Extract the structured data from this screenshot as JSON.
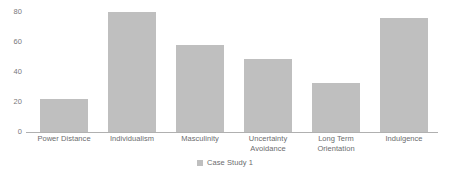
{
  "chart_data": {
    "type": "bar",
    "title": "",
    "subtitle": "",
    "xlabel": "",
    "ylabel": "",
    "categories": [
      "Power Distance",
      "Individualism",
      "Masculinity",
      "Uncertainty Avoidance",
      "Long Term Orientation",
      "Indulgence"
    ],
    "category_lines": [
      [
        "Power Distance"
      ],
      [
        "Individualism"
      ],
      [
        "Masculinity"
      ],
      [
        "Uncertainty",
        "Avoidance"
      ],
      [
        "Long Term",
        "Orientation"
      ],
      [
        "Indulgence"
      ]
    ],
    "series": [
      {
        "name": "Case Study 1",
        "color": "#bfbfbf",
        "values": [
          22,
          80,
          58,
          49,
          33,
          76
        ]
      }
    ],
    "ylim": [
      0,
      80
    ],
    "yticks": [
      0,
      20,
      40,
      60,
      80
    ],
    "ytick_labels": [
      "0",
      "20",
      "40",
      "60",
      "80"
    ],
    "grid": false,
    "legend_position": "bottom-center",
    "axis_color": "#b0b0b0",
    "tick_label_color": "#77787b"
  },
  "legend": {
    "entries": [
      {
        "label": "Case Study 1",
        "marker": "square-swatch",
        "color": "#bfbfbf"
      }
    ]
  }
}
